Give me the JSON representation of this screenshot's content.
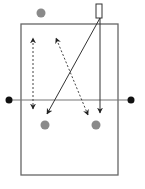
{
  "diagram": {
    "type": "drill-diagram",
    "canvas": {
      "width": 145,
      "height": 189
    },
    "colors": {
      "court_line": "#666666",
      "net_line": "#777777",
      "player": "#8a8a8a",
      "net_post": "#111111",
      "arrow": "#333333",
      "background": "#ffffff"
    },
    "court": {
      "x": 21,
      "y": 24,
      "width": 97,
      "height": 151
    },
    "net": {
      "y": 100,
      "x1": 9,
      "x2": 131
    },
    "net_posts": [
      {
        "id": "left-post",
        "cx": 9,
        "cy": 100,
        "r": 3.5
      },
      {
        "id": "right-post",
        "cx": 131,
        "cy": 100,
        "r": 3.5
      }
    ],
    "players": [
      {
        "id": "top-player",
        "cx": 41,
        "cy": 13,
        "r": 4.5
      },
      {
        "id": "bottom-left-player",
        "cx": 45,
        "cy": 125,
        "r": 4.5
      },
      {
        "id": "bottom-right-player",
        "cx": 96,
        "cy": 125,
        "r": 4.5
      }
    ],
    "cone": {
      "x": 96,
      "y": 4,
      "width": 6,
      "height": 14
    },
    "paths": [
      {
        "id": "dashed-left",
        "style": "dashed",
        "x1": 33,
        "y1": 109,
        "x2": 33,
        "y2": 38,
        "arrow_start": true,
        "arrow_end": true
      },
      {
        "id": "dashed-diagonal",
        "style": "dashed",
        "x1": 88,
        "y1": 115,
        "x2": 56,
        "y2": 38,
        "arrow_start": true,
        "arrow_end": true
      },
      {
        "id": "solid-diagonal",
        "style": "solid",
        "x1": 100,
        "y1": 18,
        "x2": 47,
        "y2": 114,
        "arrow_start": false,
        "arrow_end": true
      },
      {
        "id": "solid-vertical",
        "style": "solid",
        "x1": 100,
        "y1": 18,
        "x2": 100,
        "y2": 113,
        "arrow_start": false,
        "arrow_end": true
      }
    ]
  }
}
